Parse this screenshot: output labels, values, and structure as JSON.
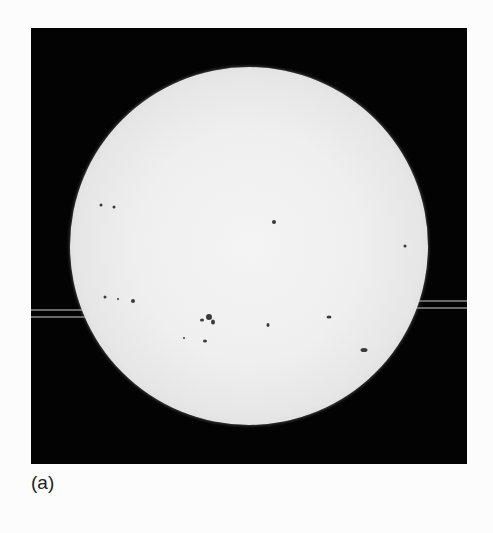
{
  "figure": {
    "caption": "(a)",
    "background_color": "#030303",
    "disk_color": "#efefef"
  },
  "sun_disk": {
    "cx": 218,
    "cy": 218,
    "r": 179
  },
  "streaks": [
    {
      "x": 0,
      "y": 281,
      "w": 60
    },
    {
      "x": 0,
      "y": 288,
      "w": 60
    },
    {
      "x": 385,
      "y": 272,
      "w": 51
    },
    {
      "x": 385,
      "y": 279,
      "w": 51
    }
  ],
  "sunspots": [
    {
      "x": 70,
      "y": 177,
      "w": 3,
      "h": 3
    },
    {
      "x": 83,
      "y": 179,
      "w": 3,
      "h": 3
    },
    {
      "x": 243,
      "y": 194,
      "w": 4,
      "h": 4
    },
    {
      "x": 374,
      "y": 218,
      "w": 3,
      "h": 3
    },
    {
      "x": 74,
      "y": 269,
      "w": 3,
      "h": 3
    },
    {
      "x": 87,
      "y": 271,
      "w": 2,
      "h": 2
    },
    {
      "x": 102,
      "y": 273,
      "w": 4,
      "h": 4
    },
    {
      "x": 178,
      "y": 289,
      "w": 6,
      "h": 6
    },
    {
      "x": 182,
      "y": 294,
      "w": 4,
      "h": 5
    },
    {
      "x": 171,
      "y": 292,
      "w": 4,
      "h": 3
    },
    {
      "x": 237,
      "y": 297,
      "w": 3,
      "h": 4
    },
    {
      "x": 298,
      "y": 289,
      "w": 5,
      "h": 3
    },
    {
      "x": 174,
      "y": 313,
      "w": 4,
      "h": 3
    },
    {
      "x": 153,
      "y": 310,
      "w": 2,
      "h": 2
    },
    {
      "x": 333,
      "y": 322,
      "w": 7,
      "h": 4
    }
  ]
}
